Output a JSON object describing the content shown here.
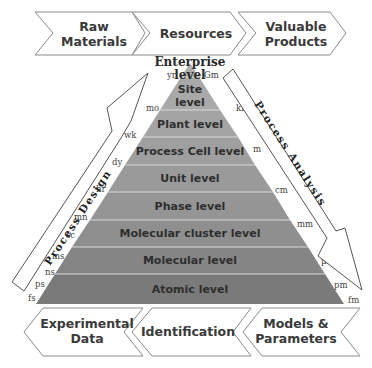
{
  "top_flow": [
    {
      "line1": "Raw",
      "line2": "Materials"
    },
    {
      "line1": "Resources",
      "line2": ""
    },
    {
      "line1": "Valuable",
      "line2": "Products"
    }
  ],
  "bottom_flow": [
    {
      "line1": "Experimental",
      "line2": "Data"
    },
    {
      "line1": "Identification",
      "line2": ""
    },
    {
      "line1": "Models &",
      "line2": "Parameters"
    }
  ],
  "pyramid": {
    "top_label": {
      "line1": "Enterprise",
      "line2": "level"
    },
    "levels": [
      {
        "line1": "Site",
        "line2": "level",
        "color": "#a9a9a9"
      },
      {
        "line1": "Plant level",
        "line2": "",
        "color": "#a4a4a4"
      },
      {
        "line1": "Process Cell level",
        "line2": "",
        "color": "#9f9f9f"
      },
      {
        "line1": "Unit level",
        "line2": "",
        "color": "#9a9a9a"
      },
      {
        "line1": "Phase level",
        "line2": "",
        "color": "#959595"
      },
      {
        "line1": "Molecular cluster level",
        "line2": "",
        "color": "#8f8f8f"
      },
      {
        "line1": "Molecular level",
        "line2": "",
        "color": "#858585"
      },
      {
        "line1": "Atomic level",
        "line2": "",
        "color": "#7a7a7a"
      }
    ],
    "apex_color": "#aeaeae"
  },
  "time_scale": [
    "yr",
    "mo",
    "wk",
    "dy",
    "hr",
    "mn",
    "sc",
    "ms",
    "ns",
    "ps",
    "fs"
  ],
  "length_scale": [
    "Gm",
    "km",
    "m",
    "cm",
    "mm",
    "µm",
    "pm",
    "fm"
  ],
  "arrows": {
    "left": "Process Design",
    "right": "Process Analysis"
  }
}
